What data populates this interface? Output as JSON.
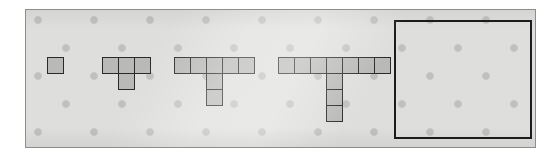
{
  "figure_title": "Growing T-shape pattern sequence",
  "panel": {
    "background_color": "#dededc",
    "border_color": "#8d8d8b",
    "dot_color": "#c0c0be",
    "dot_spacing_px": 28
  },
  "cell_style": {
    "fill_color": "#b9b9b7",
    "border_color": "#2a2a2a",
    "size_px": 17
  },
  "answer_box": {
    "label": "empty-answer-box",
    "border_color": "#1c1c1c",
    "content": ""
  },
  "chart_data": {
    "type": "table",
    "xlabel": "Figure number",
    "ylabel": "Number of unit squares",
    "categories": [
      "Figure 1",
      "Figure 2",
      "Figure 3",
      "Figure 4",
      "Figure 5"
    ],
    "values": [
      1,
      4,
      7,
      10,
      null
    ],
    "series": [
      {
        "name": "Top row squares",
        "values": [
          1,
          3,
          5,
          7,
          null
        ]
      },
      {
        "name": "Stem squares",
        "values": [
          0,
          1,
          2,
          3,
          null
        ]
      },
      {
        "name": "Total squares",
        "values": [
          1,
          4,
          7,
          10,
          null
        ]
      }
    ],
    "annotations": [
      "Figure 5 is blank — the box is left empty for the answer."
    ]
  },
  "figures": [
    {
      "name": "figure-1",
      "index": 1,
      "top_row_count": 1,
      "stem_count": 0,
      "total_squares": 1,
      "left": 21,
      "top": 47,
      "cells": [
        {
          "x": 0,
          "y": 0
        }
      ]
    },
    {
      "name": "figure-2",
      "index": 2,
      "top_row_count": 3,
      "stem_count": 1,
      "total_squares": 4,
      "left": 76,
      "top": 47,
      "cells": [
        {
          "x": 0,
          "y": 0
        },
        {
          "x": 16,
          "y": 0
        },
        {
          "x": 32,
          "y": 0
        },
        {
          "x": 16,
          "y": 16
        }
      ]
    },
    {
      "name": "figure-3",
      "index": 3,
      "top_row_count": 5,
      "stem_count": 2,
      "total_squares": 7,
      "left": 148,
      "top": 47,
      "cells": [
        {
          "x": 0,
          "y": 0
        },
        {
          "x": 16,
          "y": 0
        },
        {
          "x": 32,
          "y": 0
        },
        {
          "x": 48,
          "y": 0
        },
        {
          "x": 64,
          "y": 0
        },
        {
          "x": 32,
          "y": 16
        },
        {
          "x": 32,
          "y": 32
        }
      ]
    },
    {
      "name": "figure-4",
      "index": 4,
      "top_row_count": 7,
      "stem_count": 3,
      "total_squares": 10,
      "left": 252,
      "top": 47,
      "cells": [
        {
          "x": 0,
          "y": 0
        },
        {
          "x": 16,
          "y": 0
        },
        {
          "x": 32,
          "y": 0
        },
        {
          "x": 48,
          "y": 0
        },
        {
          "x": 64,
          "y": 0
        },
        {
          "x": 80,
          "y": 0
        },
        {
          "x": 96,
          "y": 0
        },
        {
          "x": 48,
          "y": 16
        },
        {
          "x": 48,
          "y": 32
        },
        {
          "x": 48,
          "y": 48
        }
      ]
    }
  ]
}
